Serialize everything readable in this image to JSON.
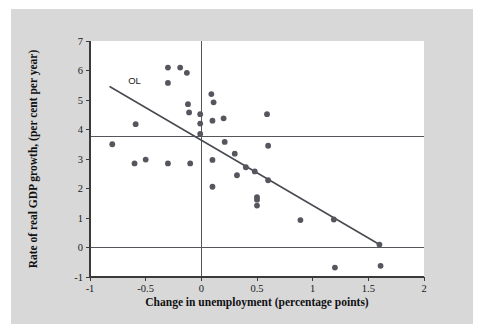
{
  "figure": {
    "background_color": "#d8d8d8",
    "plot_background_color": "#ffffff",
    "point_color": "#55565e",
    "line_color": "#4a4b52",
    "axis_color": "#3a3a3a"
  },
  "chart_data": {
    "type": "scatter",
    "title": "",
    "xlabel": "Change in unemployment (percentage points)",
    "ylabel": "Rate of real GDP growth, (per cent per year)",
    "xlim": [
      -1,
      2
    ],
    "ylim": [
      -1,
      7
    ],
    "xticks": [
      -1,
      -0.5,
      0,
      0.5,
      1,
      1.5,
      2
    ],
    "xtick_labels": [
      "-1",
      "-0.5",
      "0",
      "0.5",
      "1",
      "1.5",
      "2"
    ],
    "yticks": [
      -1,
      0,
      1,
      2,
      3,
      4,
      5,
      6,
      7
    ],
    "ytick_labels": [
      "-1",
      "0",
      "1",
      "2",
      "3",
      "4",
      "5",
      "6",
      "7"
    ],
    "grid": false,
    "legend": null,
    "reference_lines": [
      {
        "name": "zero-growth-line",
        "orientation": "horizontal",
        "value": 0
      },
      {
        "name": "average-growth-line",
        "orientation": "horizontal",
        "value": 3.75
      },
      {
        "name": "zero-unemployment-change-line",
        "orientation": "vertical",
        "value": 0
      }
    ],
    "annotations": [
      {
        "name": "okuns-law-label",
        "text": "OL",
        "x": -0.6,
        "y": 5.55
      }
    ],
    "fit_line": {
      "name": "okuns-law-line",
      "label": "OL",
      "x_start": -0.82,
      "y_start": 5.45,
      "x_end": 1.6,
      "y_end": 0.1
    },
    "points": [
      {
        "x": -0.8,
        "y": 3.5
      },
      {
        "x": -0.6,
        "y": 2.85
      },
      {
        "x": -0.59,
        "y": 4.18
      },
      {
        "x": -0.5,
        "y": 2.98
      },
      {
        "x": -0.3,
        "y": 6.1
      },
      {
        "x": -0.3,
        "y": 5.58
      },
      {
        "x": -0.3,
        "y": 2.85
      },
      {
        "x": -0.19,
        "y": 6.1
      },
      {
        "x": -0.13,
        "y": 5.92
      },
      {
        "x": -0.12,
        "y": 4.86
      },
      {
        "x": -0.11,
        "y": 4.58
      },
      {
        "x": -0.1,
        "y": 2.85
      },
      {
        "x": -0.01,
        "y": 4.52
      },
      {
        "x": -0.01,
        "y": 4.2
      },
      {
        "x": -0.01,
        "y": 3.85
      },
      {
        "x": 0.09,
        "y": 5.2
      },
      {
        "x": 0.11,
        "y": 4.92
      },
      {
        "x": 0.1,
        "y": 4.3
      },
      {
        "x": 0.1,
        "y": 2.97
      },
      {
        "x": 0.1,
        "y": 2.06
      },
      {
        "x": 0.2,
        "y": 4.38
      },
      {
        "x": 0.21,
        "y": 3.58
      },
      {
        "x": 0.3,
        "y": 3.18
      },
      {
        "x": 0.32,
        "y": 2.45
      },
      {
        "x": 0.4,
        "y": 2.72
      },
      {
        "x": 0.48,
        "y": 2.58
      },
      {
        "x": 0.5,
        "y": 1.71
      },
      {
        "x": 0.5,
        "y": 1.62
      },
      {
        "x": 0.5,
        "y": 1.42
      },
      {
        "x": 0.59,
        "y": 4.52
      },
      {
        "x": 0.6,
        "y": 3.45
      },
      {
        "x": 0.6,
        "y": 2.28
      },
      {
        "x": 0.89,
        "y": 0.93
      },
      {
        "x": 1.19,
        "y": 0.95
      },
      {
        "x": 1.2,
        "y": -0.68
      },
      {
        "x": 1.6,
        "y": 0.1
      },
      {
        "x": 1.61,
        "y": -0.62
      }
    ]
  }
}
